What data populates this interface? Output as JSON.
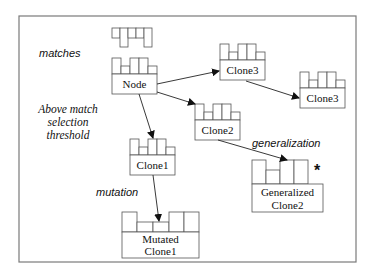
{
  "diagram": {
    "annotations": {
      "matches": "matches",
      "threshold_line1": "Above match",
      "threshold_line2": "selection",
      "threshold_line3": "threshold",
      "mutation": "mutation",
      "generalization": "generalization",
      "generalized_marker": "*"
    },
    "nodes": {
      "node": {
        "label": "Node"
      },
      "clone3_a": {
        "label": "Clone3"
      },
      "clone3_b": {
        "label": "Clone3"
      },
      "clone2": {
        "label": "Clone2"
      },
      "clone1": {
        "label": "Clone1"
      },
      "mutated": {
        "line1": "Mutated",
        "line2": "Clone1"
      },
      "generalized": {
        "line1": "Generalized",
        "line2": "Clone2"
      }
    },
    "edges": [
      {
        "from": "Node",
        "to": "Clone3"
      },
      {
        "from": "Clone3",
        "to": "Clone3"
      },
      {
        "from": "Node",
        "to": "Clone2"
      },
      {
        "from": "Node",
        "to": "Clone1"
      },
      {
        "from": "Clone1",
        "to": "Mutated Clone1",
        "label": "mutation"
      },
      {
        "from": "Clone2",
        "to": "Generalized Clone2",
        "label": "generalization"
      }
    ]
  }
}
